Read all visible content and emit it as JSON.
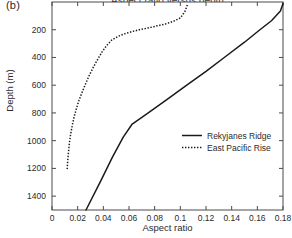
{
  "panel": {
    "label": "(b)"
  },
  "chart_data": {
    "type": "line",
    "title": "Aspect ratio versus depth",
    "xlabel": "Aspect ratio",
    "ylabel": "Depth (m)",
    "xlim": [
      0,
      0.18
    ],
    "ylim": [
      0,
      1500
    ],
    "y_inverted": true,
    "grid": false,
    "legend_position": "center-right",
    "xticks": [
      0,
      0.02,
      0.04,
      0.06,
      0.08,
      0.1,
      0.12,
      0.14,
      0.16,
      0.18
    ],
    "xticklabels": [
      "0",
      "0.02",
      "0.04",
      "0.06",
      "0.08",
      "0.1",
      "0.12",
      "0.14",
      "0.16",
      "0.18"
    ],
    "yticks": [
      200,
      400,
      600,
      800,
      1000,
      1200,
      1400
    ],
    "yticklabels": [
      "200",
      "400",
      "600",
      "800",
      "1000",
      "1200",
      "1400"
    ],
    "series": [
      {
        "name": "Rekyjanes Ridge",
        "style": "solid",
        "color": "#1a1a1a",
        "x": [
          0.0265,
          0.038,
          0.047,
          0.0555,
          0.0625,
          0.075,
          0.09,
          0.105,
          0.12,
          0.135,
          0.15,
          0.162,
          0.171,
          0.178,
          0.18
        ],
        "y": [
          1500,
          1290,
          1120,
          975,
          880,
          800,
          700,
          600,
          500,
          395,
          290,
          200,
          135,
          65,
          10
        ]
      },
      {
        "name": "East Pacific Rise",
        "style": "dotted",
        "color": "#1a1a1a",
        "x": [
          0.0118,
          0.0122,
          0.0128,
          0.0135,
          0.0145,
          0.0158,
          0.0172,
          0.019,
          0.021,
          0.0235,
          0.0262,
          0.029,
          0.0322,
          0.0355,
          0.039,
          0.0425,
          0.0465,
          0.0515,
          0.057,
          0.063,
          0.069,
          0.0755,
          0.082,
          0.0885,
          0.0945,
          0.1,
          0.1035,
          0.1055
        ],
        "y": [
          1205,
          1150,
          1085,
          1020,
          955,
          890,
          830,
          770,
          710,
          650,
          590,
          530,
          470,
          415,
          360,
          315,
          275,
          248,
          228,
          212,
          198,
          186,
          172,
          158,
          140,
          115,
          70,
          20
        ]
      }
    ]
  }
}
